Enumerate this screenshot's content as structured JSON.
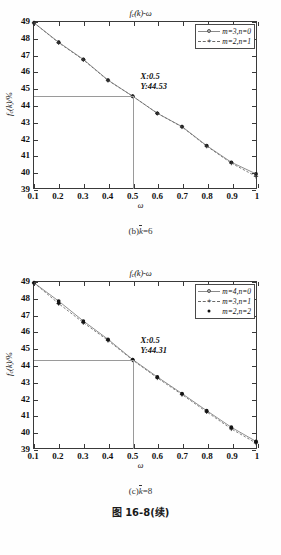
{
  "page": {
    "figure_number": "图 16-8(续)"
  },
  "charts": [
    {
      "id": "chart-b",
      "title": "f",
      "title_sub": "c",
      "title_rest": "(k)-ω",
      "caption_prefix": "(b)",
      "caption_var": "k",
      "caption_suffix": "=6",
      "xlabel": "ω",
      "ylabel_main": "f",
      "ylabel_sub": "c",
      "ylabel_rest": "(k)/%",
      "legend": [
        {
          "label": "m=3,n=0",
          "marker": "circle",
          "line": "solid"
        },
        {
          "label": "m=2,n=1",
          "marker": "plus",
          "line": "dashed"
        }
      ],
      "annotation": {
        "x_text": "X:0.5",
        "y_text": "Y:44.53"
      },
      "chart_data": {
        "type": "line",
        "title": "f_c(k)-ω",
        "xlabel": "ω",
        "ylabel": "f_c(k)/%",
        "xlim": [
          0.1,
          1.0
        ],
        "ylim": [
          39,
          49
        ],
        "xticks": [
          0.1,
          0.2,
          0.3,
          0.4,
          0.5,
          0.6,
          0.7,
          0.8,
          0.9,
          1
        ],
        "xticklabels": [
          "0.1",
          "0.2",
          "0.3",
          "0.4",
          "0.5",
          "0.6",
          "0.7",
          "0.8",
          "0.9",
          "1"
        ],
        "yticks": [
          39,
          40,
          41,
          42,
          43,
          44,
          45,
          46,
          47,
          48,
          49
        ],
        "yticklabels": [
          "39",
          "40",
          "41",
          "42",
          "43",
          "44",
          "45",
          "46",
          "47",
          "48",
          "49"
        ],
        "grid": false,
        "legend_position": "top-right",
        "x": [
          0.1,
          0.2,
          0.3,
          0.4,
          0.5,
          0.6,
          0.7,
          0.8,
          0.9,
          1.0
        ],
        "series": [
          {
            "name": "m=3,n=0",
            "values": [
              48.95,
              47.78,
              46.75,
              45.5,
              44.53,
              43.5,
              42.7,
              41.55,
              40.55,
              39.85
            ]
          },
          {
            "name": "m=2,n=1",
            "values": [
              48.95,
              47.75,
              46.72,
              45.48,
              44.53,
              43.5,
              42.68,
              41.52,
              40.5,
              39.7
            ]
          }
        ],
        "annotations": [
          {
            "x": 0.5,
            "y": 44.53,
            "text": "X:0.5 Y:44.53"
          }
        ]
      }
    },
    {
      "id": "chart-c",
      "title": "f",
      "title_sub": "c",
      "title_rest": "(k)-ω",
      "caption_prefix": "(c)",
      "caption_var": "k",
      "caption_suffix": "=8",
      "xlabel": "ω",
      "ylabel_main": "f",
      "ylabel_sub": "c",
      "ylabel_rest": "(k)/%",
      "legend": [
        {
          "label": "m=4,n=0",
          "marker": "circle",
          "line": "solid"
        },
        {
          "label": "m=3,n=1",
          "marker": "plus",
          "line": "dashed"
        },
        {
          "label": "m=2,n=2",
          "marker": "dot",
          "line": "none"
        }
      ],
      "annotation": {
        "x_text": "X:0.5",
        "y_text": "Y:44.31"
      },
      "chart_data": {
        "type": "line",
        "title": "f_c(k)-ω",
        "xlabel": "ω",
        "ylabel": "f_c(k)/%",
        "xlim": [
          0.1,
          1.0
        ],
        "ylim": [
          39,
          49
        ],
        "xticks": [
          0.1,
          0.2,
          0.3,
          0.4,
          0.5,
          0.6,
          0.7,
          0.8,
          0.9,
          1
        ],
        "xticklabels": [
          "0.1",
          "0.2",
          "0.3",
          "0.4",
          "0.5",
          "0.6",
          "0.7",
          "0.8",
          "0.9",
          "1"
        ],
        "yticks": [
          39,
          40,
          41,
          42,
          43,
          44,
          45,
          46,
          47,
          48,
          49
        ],
        "yticklabels": [
          "39",
          "40",
          "41",
          "42",
          "43",
          "44",
          "45",
          "46",
          "47",
          "48",
          "49"
        ],
        "grid": false,
        "legend_position": "top-right",
        "x": [
          0.1,
          0.2,
          0.3,
          0.4,
          0.5,
          0.6,
          0.7,
          0.8,
          0.9,
          1.0
        ],
        "series": [
          {
            "name": "m=4,n=0",
            "values": [
              48.95,
              47.85,
              46.65,
              45.55,
              44.33,
              43.28,
              42.28,
              41.25,
              40.25,
              39.4
            ]
          },
          {
            "name": "m=3,n=1",
            "values": [
              48.95,
              47.7,
              46.55,
              45.48,
              44.3,
              43.22,
              42.22,
              41.18,
              40.15,
              39.3
            ]
          },
          {
            "name": "m=2,n=2",
            "values": [
              48.95,
              47.72,
              46.58,
              45.5,
              44.31,
              43.25,
              42.25,
              41.2,
              40.2,
              39.35
            ]
          }
        ],
        "annotations": [
          {
            "x": 0.5,
            "y": 44.31,
            "text": "X:0.5 Y:44.31"
          }
        ]
      }
    }
  ]
}
